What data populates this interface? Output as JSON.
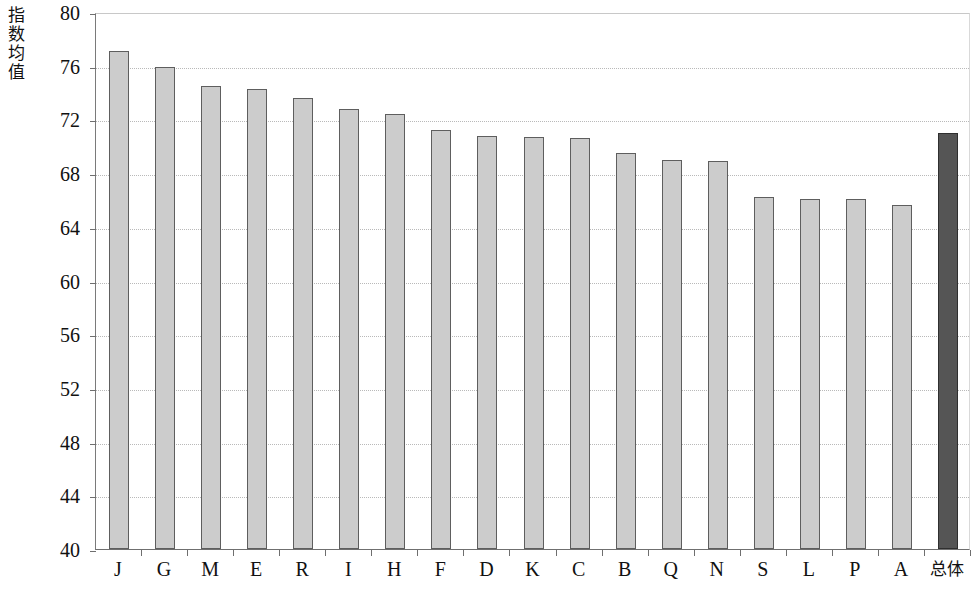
{
  "chart_data": {
    "type": "bar",
    "title": "",
    "xlabel": "",
    "ylabel": "指数均值",
    "ylim": [
      40,
      80
    ],
    "ytick_step": 4,
    "yticks": [
      80,
      76,
      72,
      68,
      64,
      60,
      56,
      52,
      48,
      44,
      40
    ],
    "ytick_labels": [
      "80",
      "76",
      "72",
      "68",
      "64",
      "60",
      "56",
      "52",
      "48",
      "44",
      "40"
    ],
    "grid": true,
    "legend": "none",
    "categories": [
      "J",
      "G",
      "M",
      "E",
      "R",
      "I",
      "H",
      "F",
      "D",
      "K",
      "C",
      "B",
      "Q",
      "N",
      "S",
      "L",
      "P",
      "A",
      "总体"
    ],
    "values": [
      77.1,
      75.9,
      74.5,
      74.3,
      73.6,
      72.8,
      72.4,
      71.2,
      70.8,
      70.7,
      70.6,
      69.5,
      69.0,
      68.9,
      66.2,
      66.1,
      66.1,
      65.6,
      71.0
    ],
    "bar_colors": [
      "#cccccc",
      "#cccccc",
      "#cccccc",
      "#cccccc",
      "#cccccc",
      "#cccccc",
      "#cccccc",
      "#cccccc",
      "#cccccc",
      "#cccccc",
      "#cccccc",
      "#cccccc",
      "#cccccc",
      "#cccccc",
      "#cccccc",
      "#cccccc",
      "#cccccc",
      "#cccccc",
      "#555555"
    ],
    "highlight_category": "总体",
    "axis_color": "#6f6f6f",
    "gridline_color": "#b9b9b9",
    "background_color": "#ffffff"
  }
}
